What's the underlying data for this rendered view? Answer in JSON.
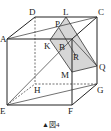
{
  "figure": {
    "caption_marker": "▲",
    "caption": "図4",
    "section_color": "#d6d6d6",
    "line_color": "#222222",
    "vertices": {
      "A": "A",
      "B": "B",
      "C": "C",
      "D": "D",
      "E": "E",
      "F": "F",
      "G": "G",
      "H": "H"
    },
    "section_points": {
      "L": "L",
      "P": "P",
      "K": "K",
      "M": "M",
      "Q": "Q",
      "R": "R"
    }
  }
}
